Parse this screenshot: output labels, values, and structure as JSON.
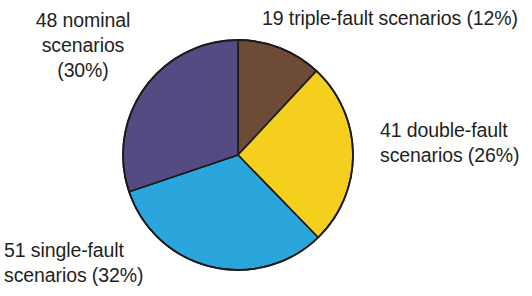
{
  "chart_data": {
    "type": "pie",
    "title": "",
    "subtitle": "",
    "xlabel": "",
    "ylabel": "",
    "grid": false,
    "legend_position": "none",
    "labels_position": "outside",
    "total_scenarios": 159,
    "start_angle_deg": 0,
    "direction": "clockwise",
    "categories": [
      "triple-fault scenarios",
      "double-fault scenarios",
      "single-fault scenarios",
      "nominal scenarios"
    ],
    "values": [
      19,
      41,
      51,
      48
    ],
    "percentages": [
      12,
      26,
      32,
      30
    ],
    "colors": [
      "#6e4b36",
      "#f4cf1e",
      "#2ba6dd",
      "#534b82"
    ],
    "slices": [
      {
        "name": "triple-fault",
        "count": 19,
        "percent": 12,
        "color": "#6e4b36",
        "start_angle_deg": 0,
        "end_angle_deg": 43.2,
        "label_text": "19 triple-fault scenarios (12%)"
      },
      {
        "name": "double-fault",
        "count": 41,
        "percent": 26,
        "color": "#f4cf1e",
        "start_angle_deg": 43.2,
        "end_angle_deg": 136.8,
        "label_text": "41 double-fault\nscenarios (26%)"
      },
      {
        "name": "single-fault",
        "count": 51,
        "percent": 32,
        "color": "#2ba6dd",
        "start_angle_deg": 136.8,
        "end_angle_deg": 252.0,
        "label_text": "51 single-fault\nscenarios (32%)"
      },
      {
        "name": "nominal",
        "count": 48,
        "percent": 30,
        "color": "#534b82",
        "start_angle_deg": 252.0,
        "end_angle_deg": 360.0,
        "label_text": "48 nominal\nscenarios\n(30%)"
      }
    ]
  },
  "labels": {
    "nominal": "48 nominal\nscenarios\n(30%)",
    "triple_fault": "19 triple-fault scenarios (12%)",
    "double_fault": "41 double-fault\nscenarios (26%)",
    "single_fault": "51 single-fault\nscenarios (32%)"
  },
  "style": {
    "background": "#ffffff",
    "text_color": "#231f20",
    "outline_color": "#1a1a1a"
  }
}
